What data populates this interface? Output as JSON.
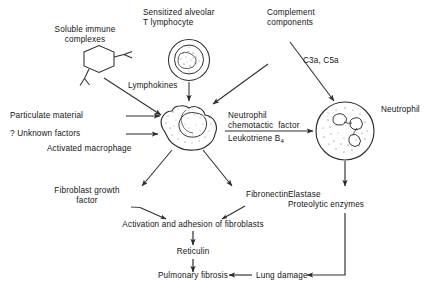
{
  "diagram": {
    "type": "flow-diagram",
    "background_color": "#ffffff",
    "line_color": "#333333",
    "text_color": "#141414"
  },
  "labels": {
    "soluble_immune_complexes": "Soluble immune\ncomplexes",
    "sensitized_alveolar_t_lymphocyte": "Sensitized alveolar\nT lymphocyte",
    "complement_components": "Complement\ncomponents",
    "lymphokines": "Lymphokines",
    "c3a_c5a": "C3a, C5a",
    "particulate_material": "Particulate material",
    "unknown_factors": "? Unknown factors",
    "activated_macrophage": "Activated macrophage",
    "neutrophil_chemotactic_factor": "Neutrophil\nchemotactic  factor",
    "leukotriene_b4_prefix": "Leukotriene B",
    "leukotriene_b4_sub": "4",
    "neutrophil": "Neutrophil",
    "fibroblast_growth_factor": "Fibroblast growth\nfactor",
    "fibronectin": "Fibronectin",
    "elastase_proteolytic_enzymes": "Elastase\nProteolytic enzymes",
    "activation_adhesion_fibroblasts": "Activation and adhesion of fibroblasts",
    "reticulin": "Reticulin",
    "pulmonary_fibrosis": "Pulmonary fibrosis",
    "lung_damage": "Lung damage"
  },
  "cells": {
    "lymphocyte": {
      "name": "t-lymphocyte-cell",
      "shape": "circle-with-nucleus"
    },
    "macrophage": {
      "name": "activated-macrophage-cell",
      "shape": "irregular-blob-with-nucleus"
    },
    "neutrophil": {
      "name": "neutrophil-cell",
      "shape": "circle-with-lobed-nucleus"
    },
    "immune_complex": {
      "name": "immune-complex-hexagon",
      "shape": "hexagon-with-antibodies"
    }
  }
}
